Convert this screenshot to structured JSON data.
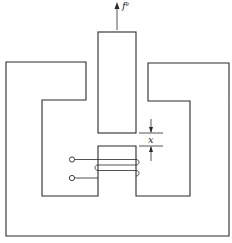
{
  "diagram": {
    "type": "electromagnetic actuator (plunger / magnetic circuit)",
    "labels": {
      "force_symbol": "f",
      "force_superscript": "e",
      "gap_symbol": "x"
    },
    "components": [
      "outer-core",
      "movable-plunger",
      "fixed-center-pole",
      "excitation-coil",
      "coil-terminals",
      "force-arrow",
      "air-gap-dimension"
    ],
    "colors": {
      "line": "#2a2a2a",
      "background": "#ffffff"
    }
  }
}
